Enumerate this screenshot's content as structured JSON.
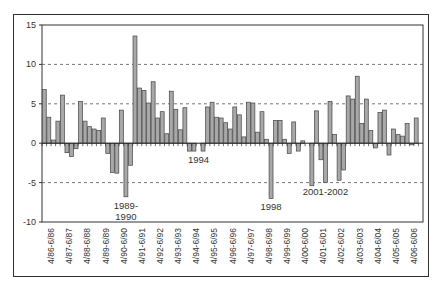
{
  "chart_data": {
    "type": "bar",
    "title": "",
    "xlabel": "",
    "ylabel": "",
    "ylim": [
      -10,
      15
    ],
    "yticks": [
      15,
      10,
      5,
      0,
      -5,
      -10
    ],
    "grid": {
      "y": true,
      "style": "dashed",
      "lines": [
        10,
        5,
        -5
      ]
    },
    "legend": null,
    "x_tick_labels": [
      "4/86-6/86",
      "4/87-6/87",
      "4/88-6/88",
      "4/89-6/89",
      "4/90-6/90",
      "4/91-6/91",
      "4/92-6/92",
      "4/93-6/93",
      "4/94-6/94",
      "4/95-6/95",
      "4/96-6/96",
      "4/97-6/97",
      "4/98-6/98",
      "4/99-6/99",
      "4/00-6/00",
      "4/01-6/01",
      "4/02-6/02",
      "4/03-6/03",
      "4/04-6/04",
      "4/05-6/05",
      "4/06-6/06"
    ],
    "series": [
      {
        "name": "value",
        "color": "#a8a8a8",
        "values": [
          6.8,
          3.3,
          0.4,
          2.8,
          6.1,
          -1.2,
          -1.7,
          -0.7,
          5.3,
          2.8,
          2.1,
          1.8,
          1.6,
          3.2,
          -1.3,
          -3.7,
          -3.8,
          4.2,
          -6.8,
          -2.8,
          13.6,
          7.0,
          6.7,
          5.1,
          7.8,
          3.2,
          4.0,
          1.2,
          6.6,
          4.3,
          1.7,
          4.5,
          -1.0,
          -1.0,
          0,
          -1.0,
          4.6,
          5.2,
          3.3,
          3.2,
          2.6,
          1.8,
          4.6,
          3.6,
          0.8,
          5.2,
          5.1,
          1.4,
          4.0,
          0.5,
          -7.0,
          2.9,
          2.9,
          0.5,
          -1.3,
          2.7,
          -1.0,
          0.3,
          0,
          -5.4,
          4.1,
          -2.1,
          -5.0,
          5.3,
          1.1,
          -4.7,
          -3.4,
          6.0,
          5.6,
          8.5,
          2.5,
          5.6,
          1.6,
          -0.6,
          3.9,
          4.2,
          -1.5,
          1.8,
          1.1,
          0.9,
          2.5,
          -0.2,
          3.2,
          0
        ]
      }
    ],
    "annotations": [
      {
        "text": [
          "1989-",
          "1990"
        ],
        "bar_index": 18
      },
      {
        "text": [
          "1994"
        ],
        "bar_index": 34
      },
      {
        "text": [
          "1998"
        ],
        "bar_index": 50
      },
      {
        "text": [
          "2001-2002"
        ],
        "bar_index": 62
      }
    ]
  }
}
